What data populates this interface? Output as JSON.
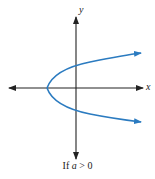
{
  "diagram": {
    "type": "parabola-graph",
    "axes": {
      "x_label": "x",
      "y_label": "y"
    },
    "curve": {
      "equation_form": "x = a(y - k)^2 + h",
      "opens": "right",
      "color": "#2b7bc0"
    },
    "caption": {
      "prefix": "If ",
      "variable": "a",
      "suffix": " > 0"
    },
    "colors": {
      "axis": "#222222",
      "curve": "#2b7bc0"
    }
  }
}
